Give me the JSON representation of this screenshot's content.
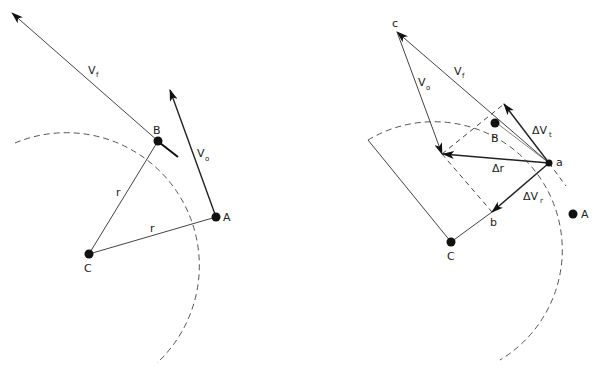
{
  "figure": {
    "left_panel": {
      "labels": {
        "vf": "V",
        "vf_sub": "f",
        "vo": "V",
        "vo_sub": "o",
        "B": "B",
        "A": "A",
        "C": "C",
        "r1": "r",
        "r2": "r"
      }
    },
    "right_panel": {
      "labels": {
        "c": "c",
        "vf": "V",
        "vf_sub": "f",
        "vo": "V",
        "vo_sub": "o",
        "B": "B",
        "dvt": "ΔV",
        "dvt_sub": "t",
        "a": "a",
        "dr": "Δr",
        "dvr": "ΔV",
        "dvr_sub": "r",
        "A": "A",
        "b": "b",
        "C": "C"
      }
    },
    "colors": {
      "ink": "#222222",
      "background": "#ffffff"
    }
  }
}
